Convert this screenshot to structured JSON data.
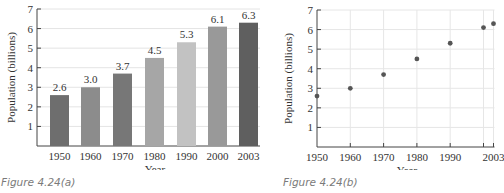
{
  "chart_data": [
    {
      "type": "bar",
      "caption": "Figure 4.24(a)",
      "categories": [
        "1950",
        "1960",
        "1970",
        "1980",
        "1990",
        "2000",
        "2003"
      ],
      "values": [
        2.6,
        3.0,
        3.7,
        4.5,
        5.3,
        6.1,
        6.3
      ],
      "data_labels": [
        "2.6",
        "3.0",
        "3.7",
        "4.5",
        "5.3",
        "6.1",
        "6.3"
      ],
      "bar_colors": [
        "#6e6e6e",
        "#8c8c8c",
        "#777777",
        "#a6a6a6",
        "#c2c2c2",
        "#999999",
        "#5f5f5f"
      ],
      "xlabel": "Year",
      "ylabel": "Population (billions)",
      "ylim": [
        0,
        7
      ],
      "yticks": [
        "1",
        "2",
        "3",
        "4",
        "5",
        "6",
        "7"
      ],
      "grid": "horizontal"
    },
    {
      "type": "scatter",
      "caption": "Figure 4.24(b)",
      "x": [
        1950,
        1960,
        1970,
        1980,
        1990,
        2000,
        2003
      ],
      "y": [
        2.6,
        3.0,
        3.7,
        4.5,
        5.3,
        6.1,
        6.3
      ],
      "xticks": [
        "1950",
        "1960",
        "1970",
        "1980",
        "1990",
        "2003"
      ],
      "xlabel": "Year",
      "ylabel": "Population (billions)",
      "ylim": [
        0,
        7
      ],
      "xlim": [
        1950,
        2003
      ],
      "yticks": [
        "1",
        "2",
        "3",
        "4",
        "5",
        "6",
        "7"
      ],
      "grid": "both",
      "marker_color": "#555555"
    }
  ]
}
